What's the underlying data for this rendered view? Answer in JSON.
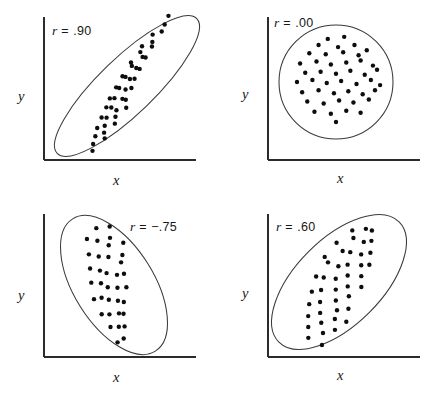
{
  "figure": {
    "panel_count": 4,
    "background_color": "#ffffff",
    "line_color": "#2b2b2b",
    "point_color": "#0d0d0d",
    "caption_fragment": ""
  },
  "chart_data": {
    "type": "scatter",
    "title": "",
    "xlabel": "x",
    "ylabel": "y",
    "grid": false,
    "legend": "none",
    "panels": [
      {
        "id": "panel-r90",
        "position": "top-left",
        "annotation": "r = .90",
        "r_symbol": "r",
        "r_value": ".90",
        "r_sign": "positive",
        "xlabel": "x",
        "ylabel": "y",
        "envelope": "ellipse",
        "envelope_rotation_deg": -44,
        "envelope_rx": 97,
        "envelope_ry": 28,
        "point_count": 41,
        "points": [
          [
            0.1,
            0.05
          ],
          [
            0.2,
            0.06
          ],
          [
            0.13,
            0.14
          ],
          [
            0.22,
            0.15
          ],
          [
            0.3,
            0.13
          ],
          [
            0.17,
            0.22
          ],
          [
            0.25,
            0.24
          ],
          [
            0.33,
            0.22
          ],
          [
            0.41,
            0.2
          ],
          [
            0.21,
            0.31
          ],
          [
            0.29,
            0.33
          ],
          [
            0.36,
            0.3
          ],
          [
            0.44,
            0.32
          ],
          [
            0.27,
            0.4
          ],
          [
            0.35,
            0.41
          ],
          [
            0.43,
            0.38
          ],
          [
            0.51,
            0.41
          ],
          [
            0.33,
            0.48
          ],
          [
            0.4,
            0.5
          ],
          [
            0.48,
            0.47
          ],
          [
            0.56,
            0.5
          ],
          [
            0.38,
            0.56
          ],
          [
            0.46,
            0.58
          ],
          [
            0.54,
            0.56
          ],
          [
            0.62,
            0.57
          ],
          [
            0.45,
            0.63
          ],
          [
            0.53,
            0.65
          ],
          [
            0.61,
            0.63
          ],
          [
            0.69,
            0.65
          ],
          [
            0.52,
            0.7
          ],
          [
            0.6,
            0.72
          ],
          [
            0.68,
            0.7
          ],
          [
            0.76,
            0.72
          ],
          [
            0.61,
            0.78
          ],
          [
            0.69,
            0.8
          ],
          [
            0.78,
            0.78
          ],
          [
            0.86,
            0.8
          ],
          [
            0.72,
            0.86
          ],
          [
            0.81,
            0.88
          ],
          [
            0.9,
            0.86
          ],
          [
            0.95,
            0.93
          ]
        ]
      },
      {
        "id": "panel-r00",
        "position": "top-right",
        "annotation": "r = .00",
        "r_symbol": "r",
        "r_value": ".00",
        "r_sign": "zero",
        "xlabel": "x",
        "ylabel": "y",
        "envelope": "circle",
        "envelope_rotation_deg": 0,
        "envelope_rx": 57,
        "envelope_ry": 57,
        "point_count": 45,
        "points": [
          [
            0.42,
            0.92
          ],
          [
            0.58,
            0.94
          ],
          [
            0.33,
            0.86
          ],
          [
            0.52,
            0.84
          ],
          [
            0.68,
            0.86
          ],
          [
            0.24,
            0.78
          ],
          [
            0.4,
            0.77
          ],
          [
            0.57,
            0.79
          ],
          [
            0.72,
            0.76
          ],
          [
            0.8,
            0.81
          ],
          [
            0.15,
            0.68
          ],
          [
            0.31,
            0.7
          ],
          [
            0.45,
            0.67
          ],
          [
            0.6,
            0.69
          ],
          [
            0.74,
            0.71
          ],
          [
            0.86,
            0.66
          ],
          [
            0.2,
            0.59
          ],
          [
            0.35,
            0.6
          ],
          [
            0.5,
            0.58
          ],
          [
            0.64,
            0.61
          ],
          [
            0.78,
            0.57
          ],
          [
            0.9,
            0.62
          ],
          [
            0.12,
            0.5
          ],
          [
            0.27,
            0.52
          ],
          [
            0.41,
            0.49
          ],
          [
            0.55,
            0.51
          ],
          [
            0.7,
            0.48
          ],
          [
            0.84,
            0.52
          ],
          [
            0.93,
            0.47
          ],
          [
            0.17,
            0.4
          ],
          [
            0.33,
            0.42
          ],
          [
            0.48,
            0.39
          ],
          [
            0.62,
            0.41
          ],
          [
            0.76,
            0.38
          ],
          [
            0.88,
            0.42
          ],
          [
            0.22,
            0.31
          ],
          [
            0.38,
            0.29
          ],
          [
            0.53,
            0.32
          ],
          [
            0.67,
            0.3
          ],
          [
            0.82,
            0.33
          ],
          [
            0.29,
            0.21
          ],
          [
            0.45,
            0.19
          ],
          [
            0.6,
            0.22
          ],
          [
            0.74,
            0.2
          ],
          [
            0.5,
            0.11
          ]
        ]
      },
      {
        "id": "panel-r-75",
        "position": "bottom-left",
        "annotation": "r = −.75",
        "r_symbol": "r",
        "r_value": "−.75",
        "r_sign": "negative",
        "xlabel": "x",
        "ylabel": "y",
        "envelope": "ellipse",
        "envelope_rotation_deg": 58,
        "envelope_rx": 78,
        "envelope_ry": 40,
        "point_count": 36,
        "points": [
          [
            0.13,
            0.88
          ],
          [
            0.28,
            0.92
          ],
          [
            0.2,
            0.8
          ],
          [
            0.35,
            0.82
          ],
          [
            0.09,
            0.71
          ],
          [
            0.24,
            0.73
          ],
          [
            0.39,
            0.75
          ],
          [
            0.47,
            0.7
          ],
          [
            0.17,
            0.63
          ],
          [
            0.31,
            0.64
          ],
          [
            0.45,
            0.61
          ],
          [
            0.56,
            0.63
          ],
          [
            0.12,
            0.52
          ],
          [
            0.27,
            0.53
          ],
          [
            0.4,
            0.5
          ],
          [
            0.53,
            0.52
          ],
          [
            0.64,
            0.49
          ],
          [
            0.22,
            0.43
          ],
          [
            0.36,
            0.44
          ],
          [
            0.49,
            0.41
          ],
          [
            0.61,
            0.43
          ],
          [
            0.71,
            0.4
          ],
          [
            0.31,
            0.34
          ],
          [
            0.44,
            0.36
          ],
          [
            0.57,
            0.33
          ],
          [
            0.69,
            0.35
          ],
          [
            0.79,
            0.32
          ],
          [
            0.4,
            0.25
          ],
          [
            0.53,
            0.26
          ],
          [
            0.66,
            0.23
          ],
          [
            0.77,
            0.25
          ],
          [
            0.86,
            0.22
          ],
          [
            0.51,
            0.16
          ],
          [
            0.63,
            0.14
          ],
          [
            0.74,
            0.15
          ],
          [
            0.86,
            0.12
          ]
        ]
      },
      {
        "id": "panel-r60",
        "position": "bottom-right",
        "annotation": "r = .60",
        "r_symbol": "r",
        "r_value": ".60",
        "r_sign": "positive",
        "xlabel": "x",
        "ylabel": "y",
        "envelope": "ellipse",
        "envelope_rotation_deg": -45,
        "envelope_rx": 85,
        "envelope_ry": 43,
        "point_count": 43,
        "points": [
          [
            0.13,
            0.08
          ],
          [
            0.26,
            0.1
          ],
          [
            0.35,
            0.07
          ],
          [
            0.19,
            0.18
          ],
          [
            0.31,
            0.2
          ],
          [
            0.42,
            0.17
          ],
          [
            0.1,
            0.27
          ],
          [
            0.23,
            0.29
          ],
          [
            0.36,
            0.26
          ],
          [
            0.48,
            0.28
          ],
          [
            0.58,
            0.25
          ],
          [
            0.15,
            0.37
          ],
          [
            0.27,
            0.39
          ],
          [
            0.4,
            0.36
          ],
          [
            0.52,
            0.38
          ],
          [
            0.63,
            0.35
          ],
          [
            0.72,
            0.38
          ],
          [
            0.2,
            0.47
          ],
          [
            0.32,
            0.49
          ],
          [
            0.45,
            0.46
          ],
          [
            0.57,
            0.48
          ],
          [
            0.68,
            0.45
          ],
          [
            0.78,
            0.48
          ],
          [
            0.26,
            0.57
          ],
          [
            0.38,
            0.59
          ],
          [
            0.5,
            0.56
          ],
          [
            0.62,
            0.58
          ],
          [
            0.73,
            0.55
          ],
          [
            0.84,
            0.58
          ],
          [
            0.33,
            0.66
          ],
          [
            0.45,
            0.68
          ],
          [
            0.57,
            0.65
          ],
          [
            0.69,
            0.67
          ],
          [
            0.8,
            0.64
          ],
          [
            0.89,
            0.67
          ],
          [
            0.42,
            0.76
          ],
          [
            0.54,
            0.78
          ],
          [
            0.66,
            0.75
          ],
          [
            0.77,
            0.77
          ],
          [
            0.87,
            0.74
          ],
          [
            0.55,
            0.86
          ],
          [
            0.67,
            0.88
          ],
          [
            0.8,
            0.85
          ]
        ]
      }
    ]
  }
}
